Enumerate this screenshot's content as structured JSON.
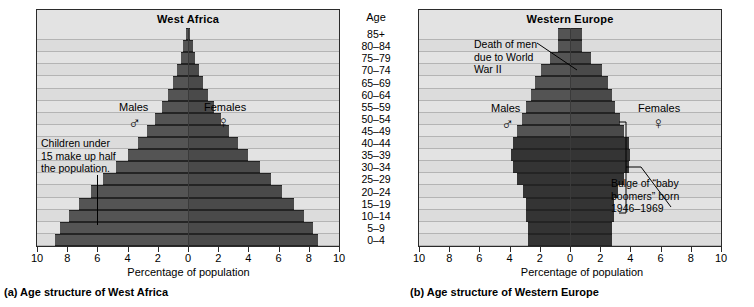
{
  "age_column": {
    "title": "Age",
    "groups": [
      "85+",
      "80–84",
      "75–79",
      "70–74",
      "65–69",
      "60–64",
      "55–59",
      "50–54",
      "45–49",
      "40–44",
      "35–39",
      "30–34",
      "25–29",
      "20–24",
      "15–19",
      "10–14",
      "5–9",
      "0–4"
    ]
  },
  "panel_a": {
    "caption": "(a) Age structure of West Africa",
    "title": "West Africa",
    "males_label": "Males",
    "females_label": "Females",
    "male_symbol": "♂",
    "female_symbol": "♀",
    "annotation": "Children under\n15 make up half\nthe population.",
    "xtitle": "Percentage of population",
    "xticks": [
      "10",
      "8",
      "6",
      "4",
      "2",
      "0",
      "2",
      "4",
      "6",
      "8",
      "10"
    ]
  },
  "panel_b": {
    "caption": "(b) Age structure of Western Europe",
    "title": "Western Europe",
    "males_label": "Males",
    "females_label": "Females",
    "male_symbol": "♂",
    "female_symbol": "♀",
    "annotation_war": "Death of men\ndue to World\nWar II",
    "annotation_boom": "Bulge of “baby\nboomers” born\n1946–1969",
    "xtitle": "Percentage of population",
    "xticks": [
      "10",
      "8",
      "6",
      "4",
      "2",
      "0",
      "2",
      "4",
      "6",
      "8",
      "10"
    ]
  },
  "chart_data": [
    {
      "type": "bar",
      "title": "West Africa",
      "subtitle": "(a) Age structure of West Africa",
      "orientation": "population-pyramid",
      "xlabel": "Percentage of population",
      "ylabel": "Age",
      "xlim": [
        -10,
        10
      ],
      "xticks": [
        10,
        8,
        6,
        4,
        2,
        0,
        2,
        4,
        6,
        8,
        10
      ],
      "grid": true,
      "legend": [
        "Males",
        "Females"
      ],
      "legend_position": "inside-upper-left-and-right",
      "categories": [
        "85+",
        "80–84",
        "75–79",
        "70–74",
        "65–69",
        "60–64",
        "55–59",
        "50–54",
        "45–49",
        "40–44",
        "35–39",
        "30–34",
        "25–29",
        "20–24",
        "15–19",
        "10–14",
        "5–9",
        "0–4"
      ],
      "series": [
        {
          "name": "Males",
          "values": [
            0.15,
            0.3,
            0.45,
            0.7,
            1.0,
            1.35,
            1.75,
            2.2,
            2.7,
            3.3,
            4.0,
            4.8,
            5.6,
            6.4,
            7.2,
            7.9,
            8.5,
            8.8
          ]
        },
        {
          "name": "Females",
          "values": [
            0.15,
            0.3,
            0.45,
            0.7,
            1.0,
            1.35,
            1.75,
            2.2,
            2.7,
            3.3,
            4.0,
            4.8,
            5.5,
            6.2,
            7.0,
            7.7,
            8.3,
            8.6
          ]
        }
      ],
      "annotations": [
        "Children under 15 make up half the population."
      ]
    },
    {
      "type": "bar",
      "title": "Western Europe",
      "subtitle": "(b) Age structure of Western Europe",
      "orientation": "population-pyramid",
      "xlabel": "Percentage of population",
      "ylabel": "Age",
      "xlim": [
        -10,
        10
      ],
      "xticks": [
        10,
        8,
        6,
        4,
        2,
        0,
        2,
        4,
        6,
        8,
        10
      ],
      "grid": true,
      "legend": [
        "Males",
        "Females"
      ],
      "legend_position": "inside-upper-left-and-right",
      "categories": [
        "85+",
        "80–84",
        "75–79",
        "70–74",
        "65–69",
        "60–64",
        "55–59",
        "50–54",
        "45–49",
        "40–44",
        "35–39",
        "30–34",
        "25–29",
        "20–24",
        "15–19",
        "10–14",
        "5–9",
        "0–4"
      ],
      "series": [
        {
          "name": "Males",
          "values": [
            0.8,
            0.8,
            1.3,
            1.9,
            2.3,
            2.6,
            2.9,
            3.2,
            3.5,
            3.8,
            3.9,
            3.8,
            3.5,
            3.1,
            2.9,
            2.9,
            2.8,
            2.8
          ]
        },
        {
          "name": "Females",
          "values": [
            0.8,
            0.8,
            1.4,
            2.1,
            2.5,
            2.8,
            3.0,
            3.3,
            3.6,
            3.9,
            4.0,
            3.9,
            3.6,
            3.2,
            2.9,
            2.9,
            2.8,
            2.8
          ]
        }
      ],
      "annotations": [
        "Death of men due to World War II",
        "Bulge of “baby boomers” born 1946–1969"
      ]
    }
  ]
}
